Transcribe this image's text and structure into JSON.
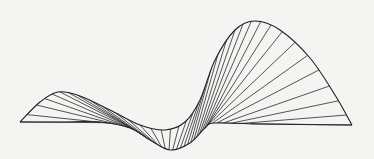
{
  "figure": {
    "stroke_color": "#2a2a2a",
    "background": "#f4f4f2",
    "line_count": 36,
    "curve_a": {
      "label": "lower-left to upper-right guide curve",
      "points": [
        [
          20,
          122
        ],
        [
          40,
          102
        ],
        [
          58,
          92
        ],
        [
          80,
          96
        ],
        [
          110,
          110
        ],
        [
          140,
          125
        ],
        [
          165,
          130
        ],
        [
          185,
          122
        ],
        [
          200,
          100
        ],
        [
          215,
          60
        ],
        [
          235,
          30
        ],
        [
          255,
          21
        ],
        [
          280,
          30
        ],
        [
          310,
          58
        ],
        [
          335,
          95
        ],
        [
          352,
          125
        ]
      ]
    },
    "curve_b": {
      "label": "base / lower guide curve",
      "points": [
        [
          20,
          122
        ],
        [
          60,
          122
        ],
        [
          100,
          122
        ],
        [
          130,
          128
        ],
        [
          150,
          140
        ],
        [
          170,
          150
        ],
        [
          190,
          143
        ],
        [
          205,
          128
        ],
        [
          215,
          123
        ],
        [
          260,
          124
        ],
        [
          300,
          124.5
        ],
        [
          352,
          125
        ]
      ]
    }
  }
}
